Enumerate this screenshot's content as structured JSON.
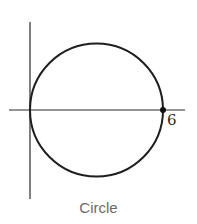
{
  "figure": {
    "caption": "Circle",
    "point_label": "6",
    "colors": {
      "stroke": "#1e1e1e",
      "axis": "#2a2a2a",
      "caption": "#6a6a6a",
      "background": "#ffffff"
    }
  },
  "diagram": {
    "shape": "circle",
    "tangent_to": "vertical axis at origin",
    "marked_point": {
      "x": 6,
      "y": 0,
      "label": "6"
    },
    "diameter": 6
  }
}
